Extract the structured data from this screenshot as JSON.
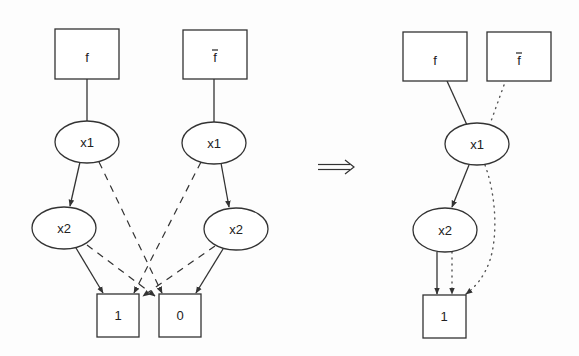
{
  "diagram": {
    "type": "BDD reduction (complement sharing)",
    "colors": {
      "stroke": "#333333",
      "background": "#fdfdfd"
    },
    "transform_symbol": "⟹",
    "left_graph": {
      "nodes": {
        "f": {
          "label": "f",
          "shape": "box"
        },
        "fbar": {
          "label": "f",
          "bar": true,
          "shape": "box"
        },
        "x1_left": {
          "label": "x1",
          "shape": "ellipse"
        },
        "x1_right": {
          "label": "x1",
          "shape": "ellipse"
        },
        "x2_left": {
          "label": "x2",
          "shape": "ellipse"
        },
        "x2_right": {
          "label": "x2",
          "shape": "ellipse"
        },
        "one": {
          "label": "1",
          "shape": "box"
        },
        "zero": {
          "label": "0",
          "shape": "box"
        }
      },
      "edges": [
        {
          "from": "f",
          "to": "x1_left",
          "style": "solid"
        },
        {
          "from": "fbar",
          "to": "x1_right",
          "style": "solid"
        },
        {
          "from": "x1_left",
          "to": "x2_left",
          "style": "solid-arrow"
        },
        {
          "from": "x1_left",
          "to": "zero",
          "style": "dashed-arrow"
        },
        {
          "from": "x1_right",
          "to": "x2_right",
          "style": "solid-arrow"
        },
        {
          "from": "x1_right",
          "to": "one",
          "style": "dashed-arrow"
        },
        {
          "from": "x2_left",
          "to": "one",
          "style": "solid-arrow"
        },
        {
          "from": "x2_left",
          "to": "zero",
          "style": "dashed-arrow"
        },
        {
          "from": "x2_right",
          "to": "zero",
          "style": "solid-arrow"
        },
        {
          "from": "x2_right",
          "to": "one",
          "style": "dashed-arrow"
        }
      ]
    },
    "right_graph": {
      "nodes": {
        "f": {
          "label": "f",
          "shape": "box"
        },
        "fbar": {
          "label": "f",
          "bar": true,
          "shape": "box"
        },
        "x1": {
          "label": "x1",
          "shape": "ellipse"
        },
        "x2": {
          "label": "x2",
          "shape": "ellipse"
        },
        "one": {
          "label": "1",
          "shape": "box"
        }
      },
      "edges": [
        {
          "from": "f",
          "to": "x1",
          "style": "solid"
        },
        {
          "from": "fbar",
          "to": "x1",
          "style": "dotted"
        },
        {
          "from": "x1",
          "to": "x2",
          "style": "solid-arrow"
        },
        {
          "from": "x1",
          "to": "one",
          "style": "dotted-arrow"
        },
        {
          "from": "x2",
          "to": "one",
          "style": "solid-arrow"
        },
        {
          "from": "x2",
          "to": "one",
          "style": "dotted-arrow"
        }
      ]
    }
  }
}
